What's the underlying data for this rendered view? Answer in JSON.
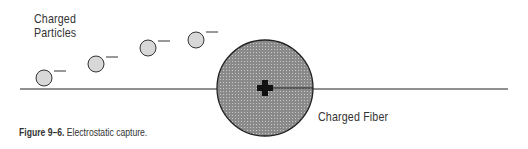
{
  "diagram": {
    "labels": {
      "particles_line1": "Charged",
      "particles_line2": "Particles",
      "fiber": "Charged Fiber"
    },
    "caption": {
      "figure_number": "Figure 9–6.",
      "text": "Electrostatic capture."
    },
    "fiber": {
      "cx": 265,
      "cy": 88,
      "r": 48,
      "charge_symbol": "+",
      "fill": "#8a8a8a"
    },
    "particles": [
      {
        "cx": 44,
        "cy": 78,
        "r": 8,
        "charge_symbol": "−"
      },
      {
        "cx": 96,
        "cy": 64,
        "r": 8,
        "charge_symbol": "−"
      },
      {
        "cx": 148,
        "cy": 48,
        "r": 8,
        "charge_symbol": "−"
      },
      {
        "cx": 196,
        "cy": 40,
        "r": 8,
        "charge_symbol": "−"
      }
    ],
    "flow_line": {
      "x1": 20,
      "x2": 508,
      "y": 89
    },
    "colors": {
      "particle_fill": "#d8d8d8",
      "stroke": "#222222"
    }
  }
}
